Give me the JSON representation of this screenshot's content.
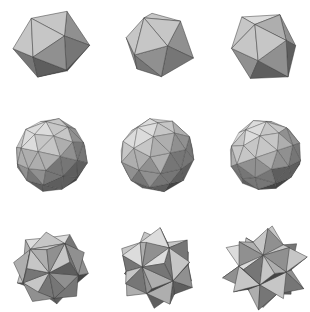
{
  "canvas": {
    "width": 309,
    "height": 312,
    "background": "#ffffff",
    "title": "Polyhedra Grid"
  },
  "grid": {
    "rows": 3,
    "cols": 3,
    "cell_width": 103,
    "cell_height": 104,
    "column_centers": [
      51,
      157,
      265
    ],
    "row_centers": [
      47,
      155,
      268
    ]
  },
  "palette": {
    "darkest": "#2a2a2a",
    "dark": "#454545",
    "mid_dark": "#5e5e5e",
    "mid": "#767676",
    "mid_light": "#909090",
    "light": "#aeaeae",
    "lighter": "#c6c6c6",
    "lightest": "#dcdcdc",
    "edge": "#3a3a3a",
    "background": "#ffffff"
  },
  "shapes": [
    {
      "id": "shape-r1c1",
      "name": "faceted-polyhedron-1",
      "row": 1,
      "col": 1,
      "center": [
        51,
        47
      ],
      "radius": 36,
      "type": "low-poly-faceted-solid",
      "seed": 11,
      "spikes": 0,
      "frequency": 1
    },
    {
      "id": "shape-r1c2",
      "name": "faceted-polyhedron-2",
      "row": 1,
      "col": 2,
      "center": [
        157,
        47
      ],
      "radius": 35,
      "type": "low-poly-faceted-solid",
      "seed": 23,
      "spikes": 0,
      "frequency": 1
    },
    {
      "id": "shape-r1c3",
      "name": "faceted-polyhedron-3",
      "row": 1,
      "col": 3,
      "center": [
        265,
        47
      ],
      "radius": 36,
      "type": "low-poly-faceted-solid",
      "seed": 37,
      "spikes": 0,
      "frequency": 1
    },
    {
      "id": "shape-r2c1",
      "name": "geodesic-sphere-1",
      "row": 2,
      "col": 1,
      "center": [
        51,
        155
      ],
      "radius": 36,
      "type": "geodesic-sphere",
      "seed": 53,
      "spikes": 0,
      "frequency": 2
    },
    {
      "id": "shape-r2c2",
      "name": "geodesic-sphere-2",
      "row": 2,
      "col": 2,
      "center": [
        157,
        155
      ],
      "radius": 37,
      "type": "geodesic-sphere",
      "seed": 67,
      "spikes": 0,
      "frequency": 2
    },
    {
      "id": "shape-r2c3",
      "name": "geodesic-sphere-3",
      "row": 2,
      "col": 3,
      "center": [
        265,
        155
      ],
      "radius": 36,
      "type": "geodesic-sphere",
      "seed": 79,
      "spikes": 0,
      "frequency": 2
    },
    {
      "id": "shape-r3c1",
      "name": "stellated-polyhedron-1",
      "row": 3,
      "col": 1,
      "center": [
        51,
        268
      ],
      "radius": 33,
      "type": "stellated-solid",
      "seed": 97,
      "spikes": 8,
      "spike_length": 0.16,
      "frequency": 1
    },
    {
      "id": "shape-r3c2",
      "name": "stellated-polyhedron-2",
      "row": 3,
      "col": 2,
      "center": [
        157,
        268
      ],
      "radius": 31,
      "type": "stellated-solid",
      "seed": 113,
      "spikes": 10,
      "spike_length": 0.34,
      "frequency": 1
    },
    {
      "id": "shape-r3c3",
      "name": "stellated-polyhedron-3",
      "row": 3,
      "col": 3,
      "center": [
        265,
        268
      ],
      "radius": 29,
      "type": "stellated-solid",
      "seed": 131,
      "spikes": 12,
      "spike_length": 0.52,
      "frequency": 1
    }
  ]
}
